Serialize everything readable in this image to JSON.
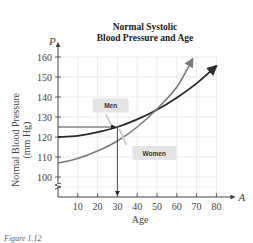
{
  "chart_data": {
    "type": "line",
    "title": "Normal Systolic Blood Pressure and Age",
    "title_lines": [
      "Normal Systolic",
      "Blood Pressure and Age"
    ],
    "xlabel": "Age",
    "ylabel": "Normal Blood Pressure (mm Hg)",
    "ylabel_lines": [
      "Normal Blood Pressure",
      "(mm Hg)"
    ],
    "x_axis_letter": "A",
    "y_axis_letter": "P",
    "xlim": [
      0,
      85
    ],
    "ylim": [
      95,
      165
    ],
    "x_ticks": [
      10,
      20,
      30,
      40,
      50,
      60,
      70,
      80
    ],
    "y_ticks": [
      100,
      110,
      120,
      130,
      140,
      150,
      160
    ],
    "grid": true,
    "y_axis_break": true,
    "series": [
      {
        "name": "Men",
        "color": "#2b2b2b",
        "x": [
          0,
          10,
          20,
          30,
          40,
          50,
          60,
          70,
          80
        ],
        "values": [
          120,
          120.6,
          122.4,
          125,
          128.8,
          133.6,
          139.6,
          146.8,
          155.5
        ]
      },
      {
        "name": "Women",
        "color": "#7a7a7a",
        "x": [
          0,
          10,
          20,
          30,
          40,
          50,
          60,
          68
        ],
        "values": [
          107,
          109.3,
          113,
          118,
          125,
          134,
          145,
          159
        ]
      }
    ],
    "annotations": [
      {
        "type": "arrow",
        "description": "horizontal arrow from P=125 on y-axis to Men curve at A=30",
        "y": 125,
        "x_to": 30
      },
      {
        "type": "arrow",
        "description": "vertical arrow from Men curve at A=30 down to x-axis",
        "x": 30,
        "y_from": 125
      }
    ],
    "legend": [
      {
        "label": "Men",
        "position": "callout box near (A≈20,P≈138)"
      },
      {
        "label": "Women",
        "position": "callout box near (A≈40,P≈113)"
      }
    ]
  },
  "labels": {
    "men": "Men",
    "women": "Women"
  },
  "caption": "Figure 1.12"
}
